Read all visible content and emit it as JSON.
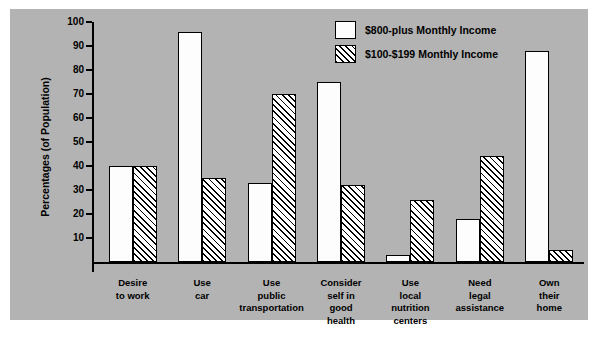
{
  "chart_data": {
    "type": "bar",
    "title": "",
    "xlabel": "",
    "ylabel": "Percentages (of Population)",
    "ylim": [
      0,
      100
    ],
    "yticks": [
      10,
      20,
      30,
      40,
      50,
      60,
      70,
      80,
      90,
      100
    ],
    "grid": false,
    "legend_position": "top-right",
    "categories": [
      "Desire\nto work",
      "Use\ncar",
      "Use\npublic\ntransportation",
      "Consider\nself in\ngood\nhealth",
      "Use\nlocal\nnutrition\ncenters",
      "Need\nlegal\nassistance",
      "Own\ntheir\nhome"
    ],
    "category_lines": [
      [
        "Desire",
        "to work"
      ],
      [
        "Use",
        "car"
      ],
      [
        "Use",
        "public",
        "transportation"
      ],
      [
        "Consider",
        "self in",
        "good",
        "health"
      ],
      [
        "Use",
        "local",
        "nutrition",
        "centers"
      ],
      [
        "Need",
        "legal",
        "assistance"
      ],
      [
        "Own",
        "their",
        "home"
      ]
    ],
    "series": [
      {
        "name": "$800-plus Monthly Income",
        "fill": "solid-white",
        "values": [
          40,
          96,
          33,
          75,
          3,
          18,
          88
        ]
      },
      {
        "name": "$100-$199 Monthly Income",
        "fill": "diagonal-hatch",
        "values": [
          40,
          35,
          70,
          32,
          26,
          44,
          5
        ]
      }
    ]
  },
  "legend": {
    "items": [
      {
        "label": "$800-plus Monthly Income",
        "swatch": "solid-white"
      },
      {
        "label": "$100-$199 Monthly Income",
        "swatch": "diagonal-hatch"
      }
    ]
  },
  "axis": {
    "y_title": "Percentages (of Population)",
    "y_tick_labels": [
      "100",
      "90",
      "80",
      "70",
      "60",
      "50",
      "40",
      "30",
      "20",
      "10"
    ]
  },
  "colors": {
    "panel_background": "#b3b3b3",
    "page_background": "#ffffff",
    "ink": "#000000",
    "bar_solid": "#fdfdfd"
  }
}
